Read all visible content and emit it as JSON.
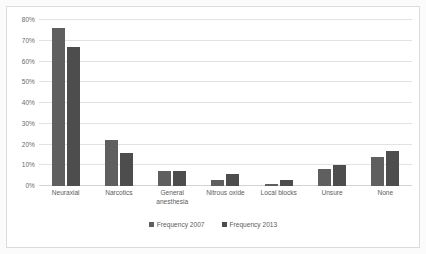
{
  "chart_data": {
    "type": "bar",
    "title": "",
    "subtitle": "",
    "xlabel": "",
    "ylabel": "",
    "categories": [
      "Neuraxial",
      "Narcotics",
      "General\nanesthesia",
      "Nitrous oxide",
      "Local blocks",
      "Unsure",
      "None"
    ],
    "series": [
      {
        "name": "Frequency 2007",
        "color": "#5f5f5f",
        "values": [
          76,
          22,
          7,
          3,
          1,
          8,
          14
        ]
      },
      {
        "name": "Frequency 2013",
        "color": "#4d4d4d",
        "values": [
          67,
          16,
          7,
          6,
          3,
          10,
          17
        ]
      }
    ],
    "ylim": [
      0,
      80
    ],
    "ytick_values": [
      0,
      10,
      20,
      30,
      40,
      50,
      60,
      70,
      80
    ],
    "ytick_labels": [
      "0%",
      "10%",
      "20%",
      "30%",
      "40%",
      "50%",
      "60%",
      "70%",
      "80%"
    ],
    "grid": true,
    "grid_axis": "y",
    "legend_position": "bottom",
    "value_unit": "%"
  },
  "legend": {
    "entries": [
      {
        "label": "Frequency 2007"
      },
      {
        "label": "Frequency 2013"
      }
    ]
  },
  "colors": {
    "series_2007": "#5f5f5f",
    "series_2013": "#4d4d4d",
    "gridline": "#e2e2e2",
    "axis_text": "#6a6a6a",
    "plot_background": "#ffffff",
    "page_background": "#fbfbfb",
    "frame_border": "#dcdcdc"
  }
}
